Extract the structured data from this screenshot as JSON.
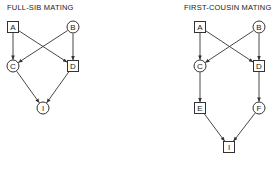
{
  "colors": {
    "stroke": "#333333",
    "text": "#222222",
    "background": "#ffffff"
  },
  "diagrams": [
    {
      "title": "FULL-SIB MATING",
      "nodes": [
        {
          "id": "A",
          "label": "A",
          "shape": "square",
          "x": 13,
          "y": 27
        },
        {
          "id": "B",
          "label": "B",
          "shape": "circle",
          "x": 73,
          "y": 27
        },
        {
          "id": "C",
          "label": "C",
          "shape": "circle",
          "x": 13,
          "y": 66
        },
        {
          "id": "D",
          "label": "D",
          "shape": "square",
          "x": 73,
          "y": 66
        },
        {
          "id": "I",
          "label": "I",
          "shape": "circle",
          "x": 43,
          "y": 108
        }
      ],
      "edges": [
        [
          "A",
          "C"
        ],
        [
          "A",
          "D"
        ],
        [
          "B",
          "C"
        ],
        [
          "B",
          "D"
        ],
        [
          "C",
          "I"
        ],
        [
          "D",
          "I"
        ]
      ]
    },
    {
      "title": "FIRST-COUSIN MATING",
      "nodes": [
        {
          "id": "A",
          "label": "A",
          "shape": "square",
          "x": 200,
          "y": 27
        },
        {
          "id": "B",
          "label": "B",
          "shape": "circle",
          "x": 259,
          "y": 27
        },
        {
          "id": "C",
          "label": "C",
          "shape": "circle",
          "x": 200,
          "y": 66
        },
        {
          "id": "D",
          "label": "D",
          "shape": "square",
          "x": 259,
          "y": 66
        },
        {
          "id": "E",
          "label": "E",
          "shape": "square",
          "x": 200,
          "y": 108
        },
        {
          "id": "F",
          "label": "F",
          "shape": "circle",
          "x": 259,
          "y": 108
        },
        {
          "id": "I",
          "label": "I",
          "shape": "square",
          "x": 229,
          "y": 147
        }
      ],
      "edges": [
        [
          "A",
          "C"
        ],
        [
          "A",
          "D"
        ],
        [
          "B",
          "C"
        ],
        [
          "B",
          "D"
        ],
        [
          "C",
          "E"
        ],
        [
          "D",
          "F"
        ],
        [
          "E",
          "I"
        ],
        [
          "F",
          "I"
        ]
      ]
    }
  ]
}
